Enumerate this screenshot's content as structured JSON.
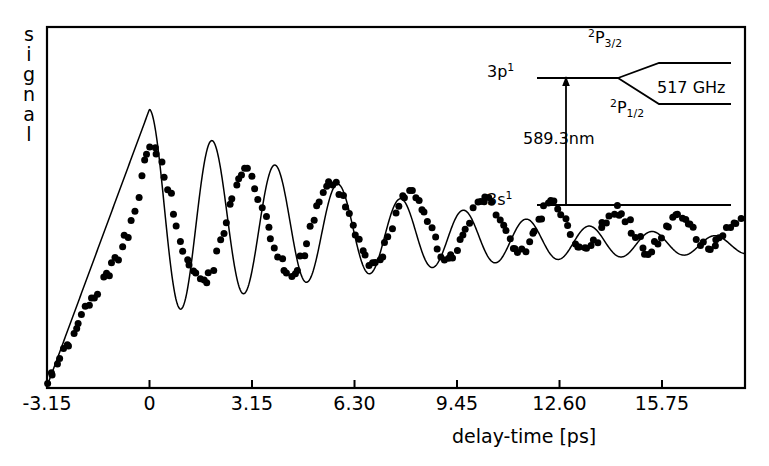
{
  "figure": {
    "y_axis_label": "signal",
    "y_axis_letters": [
      "s",
      "i",
      "g",
      "n",
      "a",
      "l"
    ],
    "x_axis_label": "delay-time [ps]",
    "line_color": "#000000",
    "marker_color": "#000000",
    "frame_color": "#000000",
    "background_color": "#ffffff"
  },
  "inset": {
    "ground_level_label": "3s",
    "ground_level_superscript": "1",
    "excited_level_label": "3p",
    "excited_level_superscript": "1",
    "fine_upper_label": "P",
    "fine_upper_superscript": "2",
    "fine_upper_subscript": "3/2",
    "fine_lower_label": "P",
    "fine_lower_superscript": "2",
    "fine_lower_subscript": "1/2",
    "splitting_label": "517 GHz",
    "transition_label": "589.3nm"
  },
  "chart_data": {
    "type": "scatter",
    "title": "",
    "xlabel": "delay-time [ps]",
    "ylabel": "signal",
    "xlim": [
      -3.15,
      18.3
    ],
    "ylim": [
      0,
      1.12
    ],
    "grid": false,
    "legend": false,
    "xticks": [
      -3.15,
      0,
      3.15,
      6.3,
      9.45,
      12.6,
      15.75
    ],
    "xticklabels": [
      "-3.15",
      "0",
      "3.15",
      "6.30",
      "9.45",
      "12.60",
      "15.75"
    ],
    "yticks": [],
    "yticklabels": [],
    "beat_period_ps": 1.933,
    "beat_frequency_ghz": 517,
    "series": [
      {
        "name": "fit",
        "type": "line",
        "comment": "smooth fitted curve: linear rise to t=0 then damped cosine beats on a slowly decaying baseline"
      },
      {
        "name": "measured",
        "type": "scatter",
        "x": [
          -3.15,
          -3.05,
          -2.95,
          -2.85,
          -2.75,
          -2.65,
          -2.55,
          -2.45,
          -2.35,
          -2.25,
          -2.15,
          -2.05,
          -1.95,
          -1.85,
          -1.75,
          -1.65,
          -1.55,
          -1.45,
          -1.35,
          -1.25,
          -1.15,
          -1.05,
          -0.95,
          -0.85,
          -0.75,
          -0.65,
          -0.55,
          -0.45,
          -0.35,
          -0.25,
          -0.15,
          -0.05,
          0.05,
          0.15,
          0.25,
          0.35,
          0.45,
          0.55,
          0.65,
          0.75,
          0.85,
          0.95,
          1.05,
          1.15,
          1.25,
          1.35,
          1.45,
          1.55,
          1.65,
          1.75,
          1.85,
          1.95,
          2.05,
          2.15,
          2.25,
          2.35,
          2.45,
          2.55,
          2.65,
          2.75,
          2.85,
          2.95,
          3.05,
          3.15,
          3.25,
          3.35,
          3.45,
          3.55,
          3.65,
          3.75,
          3.85,
          3.95,
          4.05,
          4.15,
          4.25,
          4.35,
          4.45,
          4.55,
          4.65,
          4.75,
          4.85,
          4.95,
          5.05,
          5.15,
          5.25,
          5.35,
          5.45,
          5.55,
          5.65,
          5.75,
          5.85,
          5.95,
          6.05,
          6.15,
          6.25,
          6.35,
          6.45,
          6.55,
          6.65,
          6.75,
          6.85,
          6.95,
          7.05,
          7.15,
          7.25,
          7.35,
          7.45,
          7.55,
          7.65,
          7.75,
          7.85,
          7.95,
          8.05,
          8.15,
          8.25,
          8.35,
          8.45,
          8.55,
          8.65,
          8.75,
          8.85,
          8.95,
          9.05,
          9.15,
          9.25,
          9.35,
          9.45,
          9.55,
          9.65,
          9.75,
          9.85,
          9.95,
          10.05,
          10.15,
          10.25,
          10.35,
          10.45,
          10.55,
          10.65,
          10.75,
          10.85,
          10.95,
          11.05,
          11.15,
          11.25,
          11.35,
          11.45,
          11.55,
          11.65,
          11.75,
          11.85,
          11.95,
          12.05,
          12.15,
          12.25,
          12.35,
          12.45,
          12.55,
          12.65,
          12.75,
          12.85,
          12.95,
          13.05,
          13.15,
          13.25,
          13.35,
          13.45,
          13.55,
          13.65,
          13.75,
          13.85,
          13.95,
          14.05,
          14.15,
          14.25,
          14.35,
          14.45,
          14.55,
          14.65,
          14.75,
          14.85,
          14.95,
          15.05,
          15.15,
          15.25,
          15.35,
          15.45,
          15.55,
          15.65,
          15.75,
          15.85,
          15.95,
          16.05,
          16.15,
          16.25,
          16.35,
          16.45,
          16.55,
          16.65,
          16.75,
          16.85,
          16.95,
          17.05,
          17.15,
          17.25,
          17.35,
          17.45,
          17.55,
          17.65,
          17.75,
          17.85,
          17.95,
          18.05,
          18.15
        ],
        "y": [
          0.005,
          0.035,
          0.05,
          0.075,
          0.09,
          0.115,
          0.135,
          0.145,
          0.175,
          0.185,
          0.205,
          0.215,
          0.245,
          0.25,
          0.275,
          0.29,
          0.3,
          0.33,
          0.35,
          0.345,
          0.39,
          0.4,
          0.385,
          0.44,
          0.46,
          0.465,
          0.52,
          0.55,
          0.6,
          0.645,
          0.695,
          0.735,
          0.75,
          0.755,
          0.735,
          0.705,
          0.665,
          0.625,
          0.59,
          0.55,
          0.5,
          0.46,
          0.425,
          0.4,
          0.385,
          0.37,
          0.355,
          0.345,
          0.33,
          0.335,
          0.355,
          0.375,
          0.415,
          0.45,
          0.49,
          0.525,
          0.565,
          0.6,
          0.63,
          0.66,
          0.675,
          0.68,
          0.67,
          0.655,
          0.625,
          0.595,
          0.565,
          0.535,
          0.5,
          0.465,
          0.44,
          0.415,
          0.395,
          0.375,
          0.365,
          0.36,
          0.365,
          0.375,
          0.395,
          0.425,
          0.455,
          0.49,
          0.525,
          0.56,
          0.59,
          0.615,
          0.635,
          0.645,
          0.645,
          0.635,
          0.615,
          0.59,
          0.565,
          0.535,
          0.505,
          0.475,
          0.45,
          0.425,
          0.41,
          0.395,
          0.39,
          0.395,
          0.405,
          0.42,
          0.445,
          0.475,
          0.505,
          0.535,
          0.565,
          0.59,
          0.605,
          0.615,
          0.615,
          0.605,
          0.59,
          0.565,
          0.54,
          0.515,
          0.485,
          0.46,
          0.44,
          0.42,
          0.41,
          0.405,
          0.405,
          0.415,
          0.43,
          0.45,
          0.475,
          0.5,
          0.525,
          0.55,
          0.57,
          0.585,
          0.59,
          0.59,
          0.58,
          0.565,
          0.545,
          0.52,
          0.5,
          0.475,
          0.455,
          0.44,
          0.43,
          0.425,
          0.425,
          0.435,
          0.45,
          0.47,
          0.49,
          0.515,
          0.535,
          0.555,
          0.565,
          0.57,
          0.565,
          0.555,
          0.54,
          0.52,
          0.5,
          0.48,
          0.46,
          0.445,
          0.435,
          0.43,
          0.43,
          0.435,
          0.45,
          0.465,
          0.485,
          0.505,
          0.525,
          0.54,
          0.55,
          0.555,
          0.55,
          0.54,
          0.525,
          0.51,
          0.49,
          0.47,
          0.455,
          0.44,
          0.43,
          0.425,
          0.43,
          0.44,
          0.45,
          0.47,
          0.49,
          0.505,
          0.52,
          0.53,
          0.535,
          0.535,
          0.525,
          0.515,
          0.5,
          0.485,
          0.47,
          0.455,
          0.445,
          0.44,
          0.44,
          0.445,
          0.455,
          0.465,
          0.48,
          0.495,
          0.505,
          0.515,
          0.52,
          0.52
        ]
      }
    ]
  }
}
